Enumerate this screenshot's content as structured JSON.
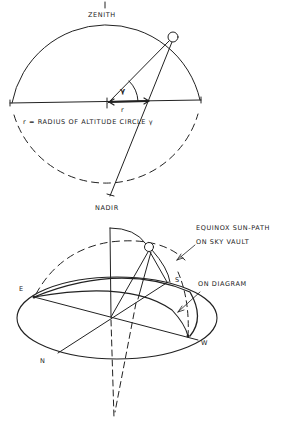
{
  "figure": {
    "top_diagram": {
      "labels": {
        "zenith": "ZENITH",
        "nadir": "NADIR",
        "gamma": "γ",
        "r": "r",
        "caption": "r = RADIUS OF ALTITUDE  CIRCLE γ"
      }
    },
    "bottom_diagram": {
      "labels": {
        "east": "E",
        "west": "W",
        "south": "S",
        "north": "N",
        "sun_path_line1": "EQUINOX SUN-PATH",
        "sun_path_line2": "ON SKY VAULT",
        "on_diagram": "ON DIAGRAM"
      }
    },
    "colors": {
      "stroke": "#222222",
      "background": "#ffffff"
    }
  }
}
